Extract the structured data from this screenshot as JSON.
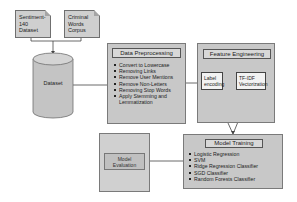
{
  "sources": [
    {
      "label": "Sentiment-140 Dataset",
      "lines": [
        "Sentiment-",
        "140",
        "Dataset"
      ]
    },
    {
      "label": "Criminal Words Corpus",
      "lines": [
        "Criminal",
        "Words",
        "Corpus"
      ]
    }
  ],
  "dataset": {
    "label": "Dataset"
  },
  "preprocessing": {
    "title": "Data Preprocessing",
    "steps": [
      "Convert to Lowercase",
      "Removing Links",
      "Remove User Mentions",
      "Remove Non-Letters",
      "Removing Stop Words",
      "Apply Stemming and Lemmatization"
    ]
  },
  "feature_engineering": {
    "title": "Feature Engineering",
    "label_encoding": {
      "lines": [
        "Label",
        "encoding"
      ]
    },
    "tfidf": {
      "lines": [
        "TF-IDF",
        "Vectorization"
      ]
    }
  },
  "model_evaluation": {
    "lines": [
      "Model",
      "Evaluation"
    ]
  },
  "model_training": {
    "title": "Model Training",
    "models": [
      "Logistic Regression",
      "SVM",
      "Ridge Regression Classifier",
      "SGD Classifier",
      "Random Forests Classifier"
    ]
  },
  "colors": {
    "box_fill": "#c8c8c8",
    "border": "#6f6f6f",
    "line": "#444444"
  }
}
